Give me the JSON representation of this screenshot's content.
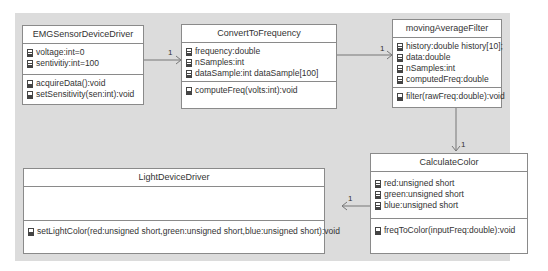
{
  "classes": {
    "emg": {
      "name": "EMGSensorDeviceDriver",
      "attributes": [
        "voltage:int=0",
        "sentivitiy:int=100"
      ],
      "operations": [
        "acquireData():void",
        "setSensitivity(sen:int):void"
      ]
    },
    "convert": {
      "name": "ConvertToFrequency",
      "attributes": [
        "frequency:double",
        "nSamples:int",
        "dataSample:int dataSample[100]"
      ],
      "operations": [
        "computeFreq(volts:int):void"
      ]
    },
    "filter": {
      "name": "movingAverageFilter",
      "attributes": [
        "history:double history[10];",
        "data:double",
        "nSamples:int",
        "computedFreq:double"
      ],
      "operations": [
        "filter(rawFreq:double):void"
      ]
    },
    "color": {
      "name": "CalculateColor",
      "attributes": [
        "red:unsigned short",
        "green:unsigned short",
        "blue:unsigned short"
      ],
      "operations": [
        "freqToColor(inputFreq:double):void"
      ]
    },
    "light": {
      "name": "LightDeviceDriver",
      "attributes": [],
      "operations": [
        "setLightColor(red:unsigned short,green:unsigned short,blue:unsigned short):void"
      ]
    }
  },
  "associations": [
    {
      "from": "EMGSensorDeviceDriver",
      "to": "ConvertToFrequency",
      "multiplicity": "1"
    },
    {
      "from": "ConvertToFrequency",
      "to": "movingAverageFilter",
      "multiplicity": "1"
    },
    {
      "from": "movingAverageFilter",
      "to": "CalculateColor",
      "multiplicity": "1"
    },
    {
      "from": "CalculateColor",
      "to": "LightDeviceDriver",
      "multiplicity": "1"
    }
  ],
  "icons": {
    "attribute": "field-icon",
    "operation": "method-icon"
  }
}
